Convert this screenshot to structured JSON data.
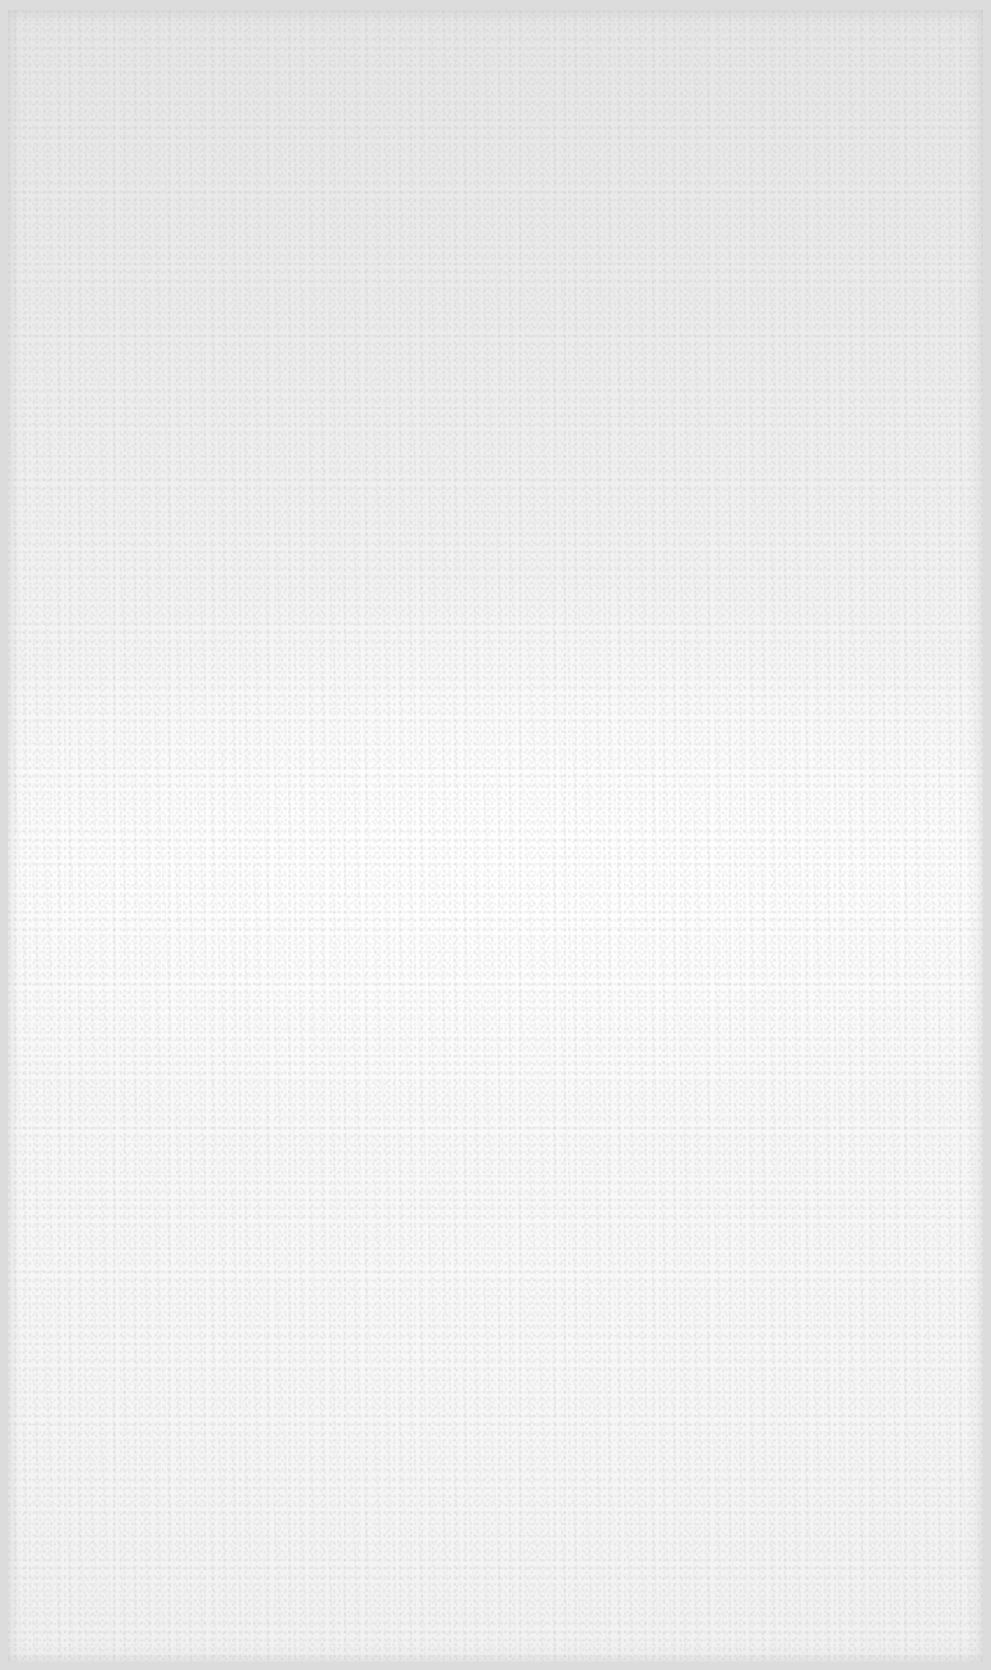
{
  "document": {
    "type": "blank-page",
    "content_text": "",
    "colors": {
      "paper": "#f4f4f4",
      "paper_top": "#e6e6e6",
      "paper_center": "#fbfbfb",
      "border": "#dcdcdc"
    }
  }
}
